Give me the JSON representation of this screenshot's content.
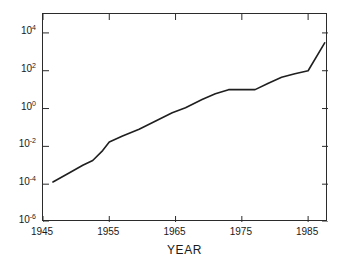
{
  "figure": {
    "top_fragment_text": "",
    "background_color": "#ffffff",
    "axis_color": "#2b2b2b",
    "line_color": "#1f1f1f"
  },
  "chart_data": {
    "type": "line",
    "title": "",
    "xlabel": "YEAR",
    "ylabel": "",
    "yscale": "log",
    "xlim": [
      1945,
      1988
    ],
    "ylim": [
      1e-06,
      100000.0
    ],
    "grid": false,
    "legend": null,
    "x_ticks": [
      1945,
      1955,
      1965,
      1975,
      1985
    ],
    "x_tick_labels": [
      "1945",
      "1955",
      "1965",
      "1975",
      "1985"
    ],
    "y_ticks": [
      10000.0,
      100.0,
      1.0,
      0.01,
      0.0001,
      1e-06
    ],
    "y_tick_labels": [
      "10",
      "10",
      "10",
      "10",
      "10",
      "10"
    ],
    "y_tick_exponents": [
      "4",
      "2",
      "0",
      "-2",
      "-4",
      "-6"
    ],
    "series": [
      {
        "name": "",
        "x": [
          1946.5,
          1949,
          1951,
          1952.5,
          1954,
          1955,
          1957,
          1959.5,
          1962,
          1964.5,
          1966.5,
          1969,
          1971,
          1973,
          1975,
          1977,
          1979,
          1981,
          1983,
          1985,
          1987.5
        ],
        "y": [
          0.00013,
          0.0004,
          0.001,
          0.0018,
          0.006,
          0.017,
          0.035,
          0.08,
          0.22,
          0.6,
          1.1,
          3.0,
          6.0,
          10.0,
          10.0,
          10.0,
          22.0,
          45.0,
          70.0,
          100.0,
          3000.0
        ]
      }
    ]
  }
}
